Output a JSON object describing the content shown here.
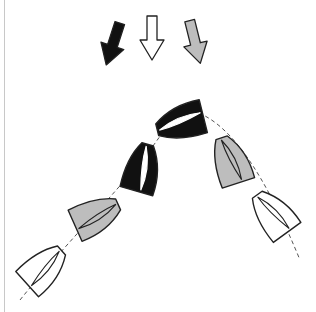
{
  "diagram": {
    "colors": {
      "black": "#111111",
      "white": "#ffffff",
      "gray": "#bdbdbd",
      "outline": "#222222",
      "track": "#555555",
      "border": "#c8c8c8"
    },
    "wind_arrows": [
      {
        "id": "arrow-black",
        "fill": "black",
        "x": 113,
        "y": 44,
        "angle": 18
      },
      {
        "id": "arrow-white",
        "fill": "white",
        "x": 152,
        "y": 38,
        "angle": 0
      },
      {
        "id": "arrow-gray",
        "fill": "gray",
        "x": 195,
        "y": 42,
        "angle": -14
      }
    ],
    "boats": [
      {
        "id": "boat-1",
        "fill": "white",
        "x": 45,
        "y": 268,
        "heading": 48
      },
      {
        "id": "boat-2",
        "fill": "gray",
        "x": 97,
        "y": 216,
        "heading": 66
      },
      {
        "id": "boat-3",
        "fill": "black",
        "x": 143,
        "y": 168,
        "heading": 16
      },
      {
        "id": "boat-4",
        "fill": "black",
        "x": 180,
        "y": 122,
        "heading": -104
      },
      {
        "id": "boat-5",
        "fill": "gray",
        "x": 231,
        "y": 160,
        "heading": -18
      },
      {
        "id": "boat-6",
        "fill": "white",
        "x": 273,
        "y": 213,
        "heading": -36
      }
    ]
  }
}
